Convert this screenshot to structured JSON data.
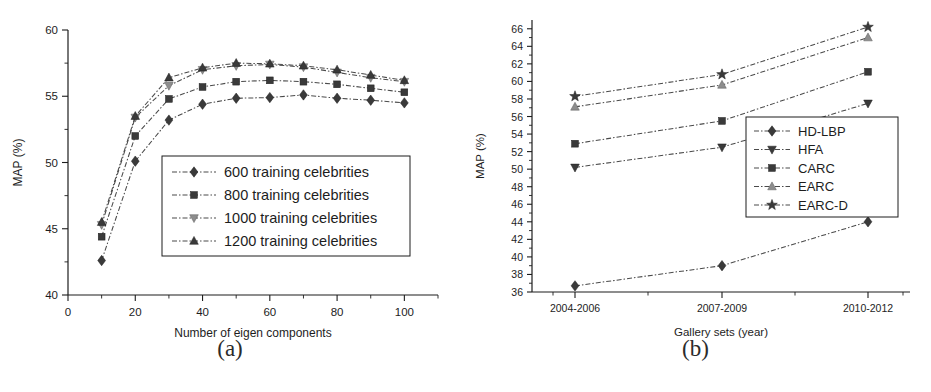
{
  "figure": {
    "panel_a_caption": "(a)",
    "panel_b_caption": "(b)"
  },
  "chart_data": [
    {
      "id": "panel-a",
      "type": "line",
      "title": "",
      "xlabel": "Number of eigen components",
      "ylabel": "MAP (%)",
      "x": [
        10,
        20,
        30,
        40,
        50,
        60,
        70,
        80,
        90,
        100
      ],
      "xlim": [
        0,
        110
      ],
      "ylim": [
        40,
        60
      ],
      "xticks": [
        0,
        20,
        40,
        60,
        80,
        100
      ],
      "xtick_labels": [
        "0",
        "20",
        "40",
        "60",
        "80",
        "100"
      ],
      "yticks": [
        40,
        45,
        50,
        55,
        60
      ],
      "ytick_labels": [
        "40",
        "45",
        "50",
        "55",
        "60"
      ],
      "grid": false,
      "legend_position": "center",
      "series": [
        {
          "name": "600 training celebrities",
          "marker": "diamond",
          "values": [
            42.6,
            50.1,
            53.2,
            54.4,
            54.85,
            54.9,
            55.1,
            54.85,
            54.7,
            54.5
          ]
        },
        {
          "name": "800 training celebrities",
          "marker": "square",
          "values": [
            44.4,
            52.0,
            54.8,
            55.7,
            56.1,
            56.2,
            56.1,
            55.9,
            55.6,
            55.3
          ]
        },
        {
          "name": "1000 training celebrities",
          "marker": "triangle-down",
          "values": [
            45.3,
            53.4,
            55.8,
            57.0,
            57.3,
            57.4,
            57.2,
            56.8,
            56.4,
            56.1
          ]
        },
        {
          "name": "1200 training celebrities",
          "marker": "triangle-up",
          "values": [
            45.5,
            53.5,
            56.4,
            57.15,
            57.5,
            57.45,
            57.3,
            57.0,
            56.6,
            56.2
          ]
        }
      ]
    },
    {
      "id": "panel-b",
      "type": "line",
      "title": "",
      "xlabel": "Gallery sets (year)",
      "ylabel": "MAP (%)",
      "categories": [
        "2004-2006",
        "2007-2009",
        "2010-2012"
      ],
      "xlim": [
        0,
        4
      ],
      "ylim": [
        36,
        67
      ],
      "yticks": [
        36,
        38,
        40,
        42,
        44,
        46,
        48,
        50,
        52,
        54,
        56,
        58,
        60,
        62,
        64,
        66
      ],
      "ytick_labels": [
        "36",
        "38",
        "40",
        "42",
        "44",
        "46",
        "48",
        "50",
        "52",
        "54",
        "56",
        "58",
        "60",
        "62",
        "64",
        "66"
      ],
      "grid": false,
      "legend_position": "right",
      "series": [
        {
          "name": "HD-LBP",
          "marker": "diamond",
          "values": [
            36.7,
            39.0,
            44.0
          ]
        },
        {
          "name": "HFA",
          "marker": "triangle-down",
          "values": [
            50.2,
            52.5,
            57.5
          ]
        },
        {
          "name": "CARC",
          "marker": "square",
          "values": [
            52.9,
            55.5,
            61.1
          ]
        },
        {
          "name": "EARC",
          "marker": "triangle-up",
          "values": [
            57.1,
            59.6,
            65.0
          ]
        },
        {
          "name": "EARC-D",
          "marker": "star",
          "values": [
            58.3,
            60.8,
            66.2
          ]
        }
      ]
    }
  ]
}
